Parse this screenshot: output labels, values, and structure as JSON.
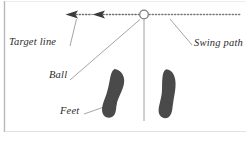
{
  "figure": {
    "background_color": "#ffffff",
    "width": 250,
    "height": 145,
    "labels": {
      "target_line": "Target line",
      "swing_path": "Swing path",
      "ball": "Ball",
      "feet": "Feet"
    },
    "colors": {
      "line": "#8c8c8c",
      "leader": "#9a9a9a",
      "text": "#2b2b2b",
      "foot_fill": "#4a4a4a",
      "ball_stroke": "#7d7d7d",
      "frame": "#b8b8b8"
    },
    "elements": {
      "ball_marker": "ball-circle",
      "target_line_style": "dotted-horizontal",
      "arrowheads": 2,
      "arrow_direction": "left",
      "foot_count": 2,
      "stance_line": "vertical-alignment-line"
    }
  }
}
